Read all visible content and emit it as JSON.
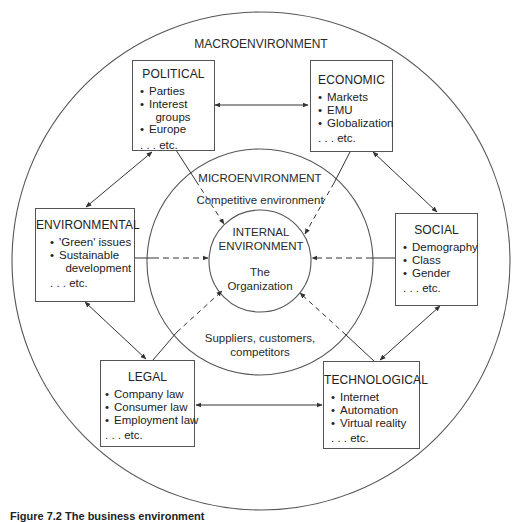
{
  "diagram": {
    "outer_label": "MACROENVIRONMENT",
    "middle_label": "MICROENVIRONMENT",
    "middle_top_text": "Competitive environment",
    "middle_bottom_text": [
      "Suppliers, customers,",
      "competitors"
    ],
    "inner_label": [
      "INTERNAL",
      "ENVIRONMENT"
    ],
    "inner_sub": [
      "The",
      "Organization"
    ]
  },
  "boxes": {
    "political": {
      "title": "POLITICAL",
      "items": [
        "Parties",
        "Interest\n  groups",
        "Europe"
      ],
      "etc": ". . . etc."
    },
    "economic": {
      "title": "ECONOMIC",
      "items": [
        "Markets",
        "EMU",
        "Globalization"
      ],
      "etc": ". . . etc."
    },
    "environmental": {
      "title": "ENVIRONMENTAL",
      "items": [
        "'Green' issues",
        "Sustainable\n  development"
      ],
      "etc": ". . . etc."
    },
    "social": {
      "title": "SOCIAL",
      "items": [
        "Demography",
        "Class",
        "Gender"
      ],
      "etc": ". . . etc."
    },
    "legal": {
      "title": "LEGAL",
      "items": [
        "Company law",
        "Consumer law",
        "Employment law"
      ],
      "etc": ". . . etc."
    },
    "technological": {
      "title": "TECHNOLOGICAL",
      "items": [
        "Internet",
        "Automation",
        "Virtual reality"
      ],
      "etc": ". . . etc."
    }
  },
  "caption": "Figure 7.2  The business environment"
}
